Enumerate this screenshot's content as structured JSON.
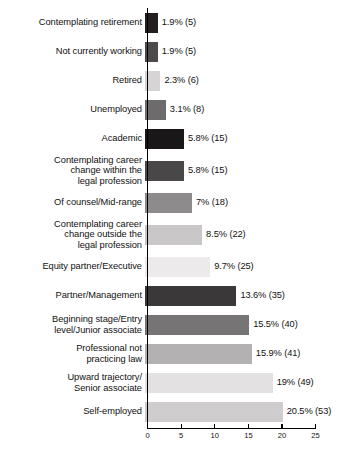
{
  "chart_data": {
    "type": "bar",
    "orientation": "horizontal",
    "title": "",
    "subtitle": "",
    "xlabel": "",
    "ylabel": "",
    "xlim": [
      0,
      25
    ],
    "xticks": [
      0,
      5,
      10,
      15,
      20,
      25
    ],
    "xtick_labels": [
      "0",
      "5",
      "10",
      "15",
      "20",
      "25"
    ],
    "grid": false,
    "legend": false,
    "categories": [
      "Contemplating retirement",
      "Not currently working",
      "Retired",
      "Unemployed",
      "Academic",
      "Contemplating career change within the legal profession",
      "Of counsel/Mid-range",
      "Contemplating career change outside the legal profession",
      "Equity partner/Executive",
      "Partner/Management",
      "Beginning stage/Entry level/Junior associate",
      "Professional not practicing law",
      "Upward trajectory/ Senior associate",
      "Self-employed"
    ],
    "values": [
      1.9,
      1.9,
      2.3,
      3.1,
      5.8,
      5.8,
      7,
      8.5,
      9.7,
      13.6,
      15.5,
      15.9,
      19,
      20.5
    ],
    "counts": [
      5,
      5,
      6,
      8,
      15,
      15,
      18,
      22,
      25,
      35,
      40,
      41,
      49,
      53
    ],
    "data_labels": [
      "1.9% (5)",
      "1.9% (5)",
      "2.3% (6)",
      "3.1% (8)",
      "5.8% (15)",
      "5.8% (15)",
      "7% (18)",
      "8.5% (22)",
      "9.7% (25)",
      "13.6% (35)",
      "15.5% (40)",
      "15.9% (41)",
      "19% (49)",
      "20.5% (53)"
    ],
    "bar_colors": [
      "#231f20",
      "#4e4b4c",
      "#d6d4d4",
      "#6e6b6c",
      "#1a1718",
      "#4a4748",
      "#8d8b8b",
      "#c9c7c7",
      "#eceaea",
      "#3b3839",
      "#777475",
      "#b3b1b1",
      "#e3e1e1",
      "#cfcdcd"
    ]
  },
  "rows": [
    {
      "label_lines": [
        "Contemplating retirement"
      ],
      "value_label": "1.9% (5)",
      "value": 1.9,
      "count": 5,
      "color": "#231f20"
    },
    {
      "label_lines": [
        "Not currently working"
      ],
      "value_label": "1.9% (5)",
      "value": 1.9,
      "count": 5,
      "color": "#4e4b4c"
    },
    {
      "label_lines": [
        "Retired"
      ],
      "value_label": "2.3% (6)",
      "value": 2.3,
      "count": 6,
      "color": "#d6d4d4"
    },
    {
      "label_lines": [
        "Unemployed"
      ],
      "value_label": "3.1% (8)",
      "value": 3.1,
      "count": 8,
      "color": "#6e6b6c"
    },
    {
      "label_lines": [
        "Academic"
      ],
      "value_label": "5.8% (15)",
      "value": 5.8,
      "count": 15,
      "color": "#1a1718"
    },
    {
      "label_lines": [
        "Contemplating career",
        "change within the",
        "legal profession"
      ],
      "value_label": "5.8% (15)",
      "value": 5.8,
      "count": 15,
      "color": "#4a4748"
    },
    {
      "label_lines": [
        "Of counsel/Mid-range"
      ],
      "value_label": "7% (18)",
      "value": 7,
      "count": 18,
      "color": "#8d8b8b"
    },
    {
      "label_lines": [
        "Contemplating career",
        "change outside the",
        "legal profession"
      ],
      "value_label": "8.5% (22)",
      "value": 8.5,
      "count": 22,
      "color": "#c9c7c7"
    },
    {
      "label_lines": [
        "Equity partner/Executive"
      ],
      "value_label": "9.7% (25)",
      "value": 9.7,
      "count": 25,
      "color": "#eceaea"
    },
    {
      "label_lines": [
        "Partner/Management"
      ],
      "value_label": "13.6% (35)",
      "value": 13.6,
      "count": 35,
      "color": "#3b3839"
    },
    {
      "label_lines": [
        "Beginning stage/Entry",
        "level/Junior associate"
      ],
      "value_label": "15.5% (40)",
      "value": 15.5,
      "count": 40,
      "color": "#777475"
    },
    {
      "label_lines": [
        "Professional not",
        "practicing law"
      ],
      "value_label": "15.9% (41)",
      "value": 15.9,
      "count": 41,
      "color": "#b3b1b1"
    },
    {
      "label_lines": [
        "Upward trajectory/",
        "Senior associate"
      ],
      "value_label": "19% (49)",
      "value": 19,
      "count": 49,
      "color": "#e3e1e1"
    },
    {
      "label_lines": [
        "Self-employed"
      ],
      "value_label": "20.5% (53)",
      "value": 20.5,
      "count": 53,
      "color": "#cfcdcd"
    }
  ],
  "axis": {
    "ticks": [
      "0",
      "5",
      "10",
      "15",
      "20",
      "25"
    ],
    "min": 0,
    "max": 25
  },
  "layout": {
    "axis_x_px": 147,
    "axis_right_px": 315,
    "row_height_single": 29,
    "row_height_double": 29,
    "row_height_triple": 35,
    "bar_height": 20
  }
}
